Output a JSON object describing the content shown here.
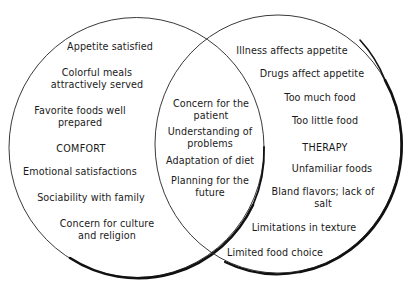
{
  "diagram": {
    "type": "venn",
    "left_set": {
      "title": "COMFORT",
      "items": [
        "Appetite satisfied",
        "Colorful meals\nattractively served",
        "Favorite foods well\nprepared",
        "Emotional satisfactions",
        "Sociability with family",
        "Concern for culture\nand religion"
      ]
    },
    "intersection": {
      "items": [
        "Concern for the\npatient",
        "Understanding of\nproblems",
        "Adaptation of diet",
        "Planning for the\nfuture"
      ]
    },
    "right_set": {
      "title": "THERAPY",
      "items": [
        "Illness affects appetite",
        "Drugs affect appetite",
        "Too much food",
        "Too little food",
        "Unfamiliar foods",
        "Bland flavors; lack of\nsalt",
        "Limitations in texture",
        "Limited food choice"
      ]
    },
    "colors": {
      "stroke": "#111111",
      "background": "#ffffff",
      "text": "#1a1a1a"
    }
  }
}
